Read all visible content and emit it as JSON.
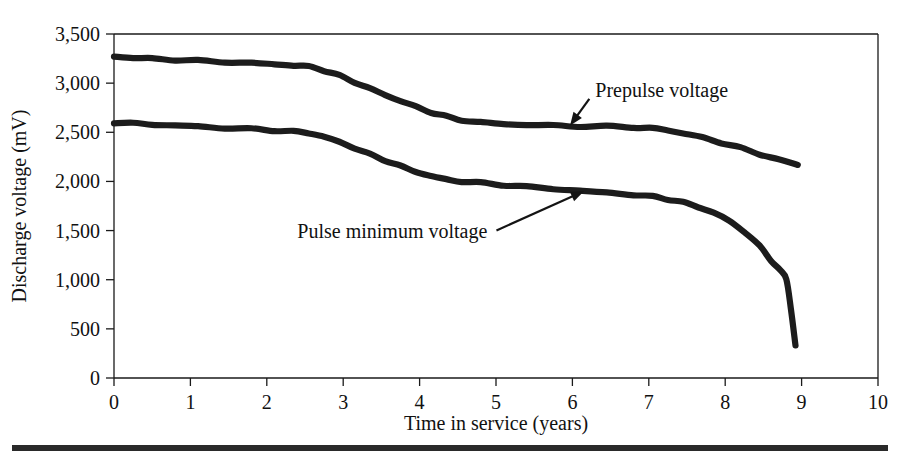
{
  "chart_data": {
    "type": "line",
    "title": "",
    "xlabel": "Time in service (years)",
    "ylabel": "Discharge voltage (mV)",
    "xlim": [
      0,
      10
    ],
    "ylim": [
      0,
      3500
    ],
    "grid": false,
    "legend_position": "inline-annotations",
    "xticks": [
      "0",
      "1",
      "2",
      "3",
      "4",
      "5",
      "6",
      "7",
      "8",
      "9",
      "10"
    ],
    "xtick_values": [
      0,
      1,
      2,
      3,
      4,
      5,
      6,
      7,
      8,
      9,
      10
    ],
    "yticks": [
      "0",
      "500",
      "1,000",
      "1,500",
      "2,000",
      "2,500",
      "3,000",
      "3,500"
    ],
    "ytick_values": [
      0,
      500,
      1000,
      1500,
      2000,
      2500,
      3000,
      3500
    ],
    "series": [
      {
        "name": "Prepulse voltage",
        "color": "#1c1c1c",
        "x": [
          0.0,
          0.25,
          0.5,
          0.8,
          1.1,
          1.45,
          1.8,
          2.1,
          2.35,
          2.55,
          2.75,
          2.95,
          3.15,
          3.35,
          3.55,
          3.75,
          3.95,
          4.15,
          4.35,
          4.55,
          4.8,
          5.1,
          5.4,
          5.75,
          6.1,
          6.45,
          6.8,
          7.05,
          7.25,
          7.45,
          7.7,
          7.95,
          8.2,
          8.45,
          8.7,
          8.95
        ],
        "y": [
          3270,
          3258,
          3248,
          3238,
          3228,
          3216,
          3204,
          3192,
          3180,
          3168,
          3130,
          3075,
          3010,
          2945,
          2880,
          2820,
          2760,
          2705,
          2660,
          2625,
          2600,
          2585,
          2575,
          2568,
          2562,
          2558,
          2552,
          2540,
          2520,
          2490,
          2445,
          2395,
          2340,
          2280,
          2220,
          2170
        ]
      },
      {
        "name": "Pulse minimum voltage",
        "color": "#1c1c1c",
        "x": [
          0.0,
          0.25,
          0.5,
          0.8,
          1.1,
          1.45,
          1.8,
          2.1,
          2.35,
          2.55,
          2.75,
          2.95,
          3.15,
          3.35,
          3.55,
          3.75,
          3.95,
          4.15,
          4.35,
          4.55,
          4.8,
          5.1,
          5.4,
          5.75,
          6.1,
          6.45,
          6.8,
          7.05,
          7.25,
          7.45,
          7.65,
          7.85,
          8.05,
          8.25,
          8.45,
          8.6,
          8.72,
          8.8,
          8.86,
          8.92
        ],
        "y": [
          2600,
          2590,
          2580,
          2570,
          2558,
          2545,
          2532,
          2520,
          2508,
          2492,
          2455,
          2400,
          2340,
          2275,
          2215,
          2155,
          2100,
          2055,
          2020,
          2000,
          1985,
          1965,
          1945,
          1925,
          1905,
          1885,
          1865,
          1845,
          1820,
          1785,
          1740,
          1680,
          1600,
          1490,
          1340,
          1200,
          1090,
          1010,
          700,
          330
        ]
      }
    ],
    "annotations": [
      {
        "text": "Prepulse voltage",
        "label_x": 6.3,
        "label_y": 2860,
        "point_x": 5.97,
        "point_y": 2570
      },
      {
        "text": "Pulse minimum voltage",
        "label_x": 2.4,
        "label_y": 1420,
        "point_x": 6.15,
        "point_y": 1900
      }
    ]
  },
  "figure": {
    "caption_rule": "thick-horizontal-rule"
  }
}
